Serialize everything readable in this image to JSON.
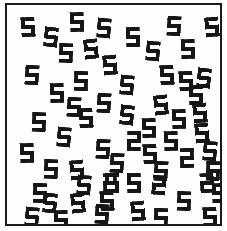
{
  "stimulus": {
    "type": "visual-search-array",
    "title": "Visual search array of blocky digits",
    "frame": {
      "border_color": "#1b1b1b",
      "background_color": "#fdfdfd",
      "page_background_color": "#ffffff",
      "border_width_px": 2,
      "left": 5,
      "top": 3,
      "width": 217,
      "height": 223
    },
    "glyph_color": "#161616",
    "distractor_character": "5",
    "target_character": "2",
    "counts": {
      "total": 61,
      "fives": 55,
      "twos": 6
    },
    "items": [
      {
        "char": "5",
        "x": 14,
        "y": 12,
        "rot": -4
      },
      {
        "char": "5",
        "x": 37,
        "y": 22,
        "rot": 6
      },
      {
        "char": "5",
        "x": 63,
        "y": 7,
        "rot": -3
      },
      {
        "char": "5",
        "x": 90,
        "y": 13,
        "rot": 5
      },
      {
        "char": "5",
        "x": 119,
        "y": 22,
        "rot": -2
      },
      {
        "char": "5",
        "x": 160,
        "y": 11,
        "rot": 4
      },
      {
        "char": "5",
        "x": 198,
        "y": 12,
        "rot": -5
      },
      {
        "char": "5",
        "x": 52,
        "y": 38,
        "rot": 3
      },
      {
        "char": "5",
        "x": 77,
        "y": 34,
        "rot": -6
      },
      {
        "char": "5",
        "x": 139,
        "y": 36,
        "rot": 5
      },
      {
        "char": "5",
        "x": 174,
        "y": 34,
        "rot": -3
      },
      {
        "char": "5",
        "x": 18,
        "y": 60,
        "rot": 4
      },
      {
        "char": "5",
        "x": 96,
        "y": 50,
        "rot": -5
      },
      {
        "char": "5",
        "x": 67,
        "y": 66,
        "rot": 2
      },
      {
        "char": "5",
        "x": 153,
        "y": 60,
        "rot": -4
      },
      {
        "char": "5",
        "x": 190,
        "y": 63,
        "rot": 6
      },
      {
        "char": "5",
        "x": 43,
        "y": 78,
        "rot": -3
      },
      {
        "char": "5",
        "x": 113,
        "y": 70,
        "rot": 5
      },
      {
        "char": "5",
        "x": 182,
        "y": 80,
        "rot": -2
      },
      {
        "char": "5",
        "x": 90,
        "y": 88,
        "rot": 4
      },
      {
        "char": "5",
        "x": 147,
        "y": 90,
        "rot": -6
      },
      {
        "char": "5",
        "x": 25,
        "y": 107,
        "rot": 3
      },
      {
        "char": "5",
        "x": 72,
        "y": 103,
        "rot": -4
      },
      {
        "char": "5",
        "x": 113,
        "y": 100,
        "rot": 6
      },
      {
        "char": "5",
        "x": 165,
        "y": 104,
        "rot": -3
      },
      {
        "char": "5",
        "x": 50,
        "y": 122,
        "rot": 5
      },
      {
        "char": "5",
        "x": 188,
        "y": 118,
        "rot": -5
      },
      {
        "char": "2",
        "x": 120,
        "y": 126,
        "rot": 2
      },
      {
        "char": "5",
        "x": 13,
        "y": 138,
        "rot": -3
      },
      {
        "char": "5",
        "x": 89,
        "y": 134,
        "rot": 4
      },
      {
        "char": "5",
        "x": 136,
        "y": 139,
        "rot": -4
      },
      {
        "char": "5",
        "x": 196,
        "y": 136,
        "rot": 5
      },
      {
        "char": "2",
        "x": 173,
        "y": 143,
        "rot": -2
      },
      {
        "char": "5",
        "x": 37,
        "y": 154,
        "rot": 3
      },
      {
        "char": "5",
        "x": 63,
        "y": 155,
        "rot": -5
      },
      {
        "char": "5",
        "x": 147,
        "y": 156,
        "rot": 4
      },
      {
        "char": "2",
        "x": 96,
        "y": 168,
        "rot": -3
      },
      {
        "char": "2",
        "x": 145,
        "y": 170,
        "rot": 5
      },
      {
        "char": "2",
        "x": 193,
        "y": 168,
        "rot": -4
      },
      {
        "char": "5",
        "x": 26,
        "y": 178,
        "rot": 2
      },
      {
        "char": "5",
        "x": 64,
        "y": 188,
        "rot": -6
      },
      {
        "char": "5",
        "x": 170,
        "y": 186,
        "rot": 3
      },
      {
        "char": "5",
        "x": 93,
        "y": 186,
        "rot": -4
      },
      {
        "char": "5",
        "x": 18,
        "y": 202,
        "rot": 5
      },
      {
        "char": "5",
        "x": 47,
        "y": 205,
        "rot": -3
      },
      {
        "char": "5",
        "x": 88,
        "y": 199,
        "rot": 4
      },
      {
        "char": "5",
        "x": 124,
        "y": 196,
        "rot": -5
      },
      {
        "char": "5",
        "x": 147,
        "y": 203,
        "rot": 2
      },
      {
        "char": "5",
        "x": 196,
        "y": 202,
        "rot": -4
      },
      {
        "char": "5",
        "x": 103,
        "y": 148,
        "rot": 4
      },
      {
        "char": "5",
        "x": 157,
        "y": 126,
        "rot": -3
      },
      {
        "char": "5",
        "x": 70,
        "y": 170,
        "rot": 5
      },
      {
        "char": "5",
        "x": 120,
        "y": 168,
        "rot": -2
      },
      {
        "char": "5",
        "x": 199,
        "y": 156,
        "rot": 3
      },
      {
        "char": "5",
        "x": 186,
        "y": 98,
        "rot": -5
      },
      {
        "char": "5",
        "x": 60,
        "y": 92,
        "rot": 4
      },
      {
        "char": "5",
        "x": 135,
        "y": 113,
        "rot": -3
      },
      {
        "char": "5",
        "x": 36,
        "y": 188,
        "rot": 6
      },
      {
        "char": "5",
        "x": 172,
        "y": 66,
        "rot": -4
      },
      {
        "char": "5",
        "x": 98,
        "y": 168,
        "rot": 0
      },
      {
        "char": "5",
        "x": 205,
        "y": 178,
        "rot": -3
      }
    ]
  }
}
